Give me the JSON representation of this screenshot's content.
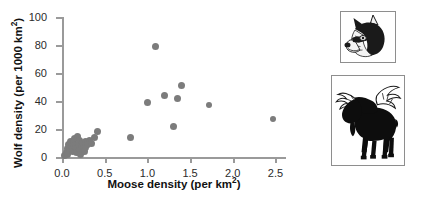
{
  "chart_data": {
    "type": "scatter",
    "title": "",
    "xlabel": "Moose density (per km2)",
    "ylabel": "Wolf density (per 1000 km2)",
    "xlabel_base": "Moose density (per km",
    "xlabel_sup": "2",
    "xlabel_tail": ")",
    "ylabel_base": "Wolf density (per 1000 km",
    "ylabel_sup": "2",
    "ylabel_tail": ")",
    "xlim": [
      0.0,
      2.6
    ],
    "ylim": [
      0,
      100
    ],
    "xticks": [
      "0.0",
      "0.5",
      "1.0",
      "1.5",
      "2.0",
      "2.5"
    ],
    "xtick_values": [
      0.0,
      0.5,
      1.0,
      1.5,
      2.0,
      2.5
    ],
    "yticks": [
      "0",
      "20",
      "40",
      "60",
      "80",
      "100"
    ],
    "ytick_values": [
      0,
      20,
      40,
      60,
      80,
      100
    ],
    "grid": false,
    "legend": "none",
    "point_color": "#7c7c7c",
    "axis_color": "#9a9a9a",
    "series": [
      {
        "name": "Wolf vs moose density",
        "points": [
          [
            0.03,
            1
          ],
          [
            0.05,
            3
          ],
          [
            0.06,
            6
          ],
          [
            0.07,
            2
          ],
          [
            0.08,
            9
          ],
          [
            0.09,
            5
          ],
          [
            0.1,
            11
          ],
          [
            0.11,
            7
          ],
          [
            0.12,
            4
          ],
          [
            0.13,
            10
          ],
          [
            0.14,
            8
          ],
          [
            0.15,
            13
          ],
          [
            0.16,
            6
          ],
          [
            0.17,
            3
          ],
          [
            0.18,
            15
          ],
          [
            0.19,
            9
          ],
          [
            0.2,
            5
          ],
          [
            0.21,
            12
          ],
          [
            0.22,
            2
          ],
          [
            0.23,
            8
          ],
          [
            0.24,
            10
          ],
          [
            0.25,
            6
          ],
          [
            0.26,
            4
          ],
          [
            0.27,
            11
          ],
          [
            0.28,
            7
          ],
          [
            0.3,
            9
          ],
          [
            0.32,
            12
          ],
          [
            0.34,
            10
          ],
          [
            0.38,
            14
          ],
          [
            0.42,
            18
          ],
          [
            0.8,
            14
          ],
          [
            1.0,
            39
          ],
          [
            1.1,
            79
          ],
          [
            1.2,
            44
          ],
          [
            1.3,
            22
          ],
          [
            1.35,
            42
          ],
          [
            1.4,
            51
          ],
          [
            1.72,
            37
          ],
          [
            2.47,
            27
          ]
        ]
      }
    ]
  },
  "illustrations": {
    "wolf": {
      "name": "wolf-head-illustration",
      "caption": ""
    },
    "moose": {
      "name": "moose-silhouette-illustration",
      "caption": ""
    }
  }
}
